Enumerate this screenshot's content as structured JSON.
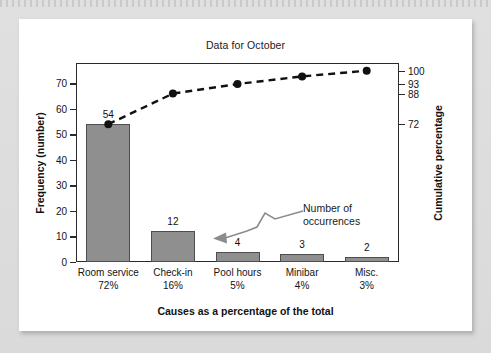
{
  "page": {
    "background_color": "#dcdcdc",
    "card_color": "#ffffff"
  },
  "chart_data": {
    "type": "bar",
    "title": "Data for October",
    "xlabel": "Causes as a percentage of the total",
    "ylabel": "Frequency (number)",
    "y2label": "Cumulative percentage",
    "categories": [
      "Room service",
      "Check-in",
      "Pool hours",
      "Minibar",
      "Misc."
    ],
    "category_percents": [
      "72%",
      "16%",
      "5%",
      "4%",
      "3%"
    ],
    "values": [
      54,
      12,
      4,
      3,
      2
    ],
    "value_labels": [
      "54",
      "12",
      "4",
      "3",
      "2"
    ],
    "cumulative_percent": [
      72,
      88,
      93,
      97,
      100
    ],
    "ylim": [
      0,
      78
    ],
    "yticks": [
      0,
      10,
      20,
      30,
      40,
      50,
      60,
      70
    ],
    "ytick_labels": [
      "0",
      "10",
      "20",
      "30",
      "40",
      "50",
      "60",
      "70"
    ],
    "y2lim": [
      0,
      104
    ],
    "y2ticks": [
      72,
      88,
      93,
      100
    ],
    "y2tick_labels": [
      "72",
      "88",
      "93",
      "100"
    ],
    "grid": false,
    "legend": false,
    "bar_color": "#8f8f8f",
    "bar_edge_color": "#4d4d4d",
    "line_color": "#111111",
    "line_style": "dashed",
    "marker": "circle",
    "annotations": [
      {
        "name": "number-of-occurrences",
        "line1": "Number of",
        "line2": "occurrences",
        "points_to": "bar-value-check-in",
        "arrow_color": "#8c8c8c",
        "arrow_style": "zigzag"
      }
    ]
  }
}
